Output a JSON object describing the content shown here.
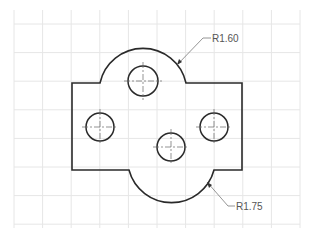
{
  "drawing": {
    "type": "mechanical-part-drawing",
    "colors": {
      "background": "#ffffff",
      "grid": "#e4e4e4",
      "outline": "#2a2a2a",
      "centerline": "#777777",
      "leader": "#777777",
      "text": "#555555"
    },
    "grid": {
      "x_start": 14,
      "x_end": 300,
      "y_start": 10,
      "y_end": 228,
      "spacing": 28.6
    },
    "dimensions": [
      {
        "label": "R1.60",
        "target": "top-arc"
      },
      {
        "label": "R1.75",
        "target": "bottom-arc"
      }
    ],
    "holes": [
      {
        "name": "top",
        "cx": 143,
        "cy": 81,
        "r": 15
      },
      {
        "name": "left",
        "cx": 100,
        "cy": 127,
        "r": 14
      },
      {
        "name": "right",
        "cx": 214,
        "cy": 127,
        "r": 14
      },
      {
        "name": "bottom",
        "cx": 171,
        "cy": 147,
        "r": 14
      }
    ]
  }
}
